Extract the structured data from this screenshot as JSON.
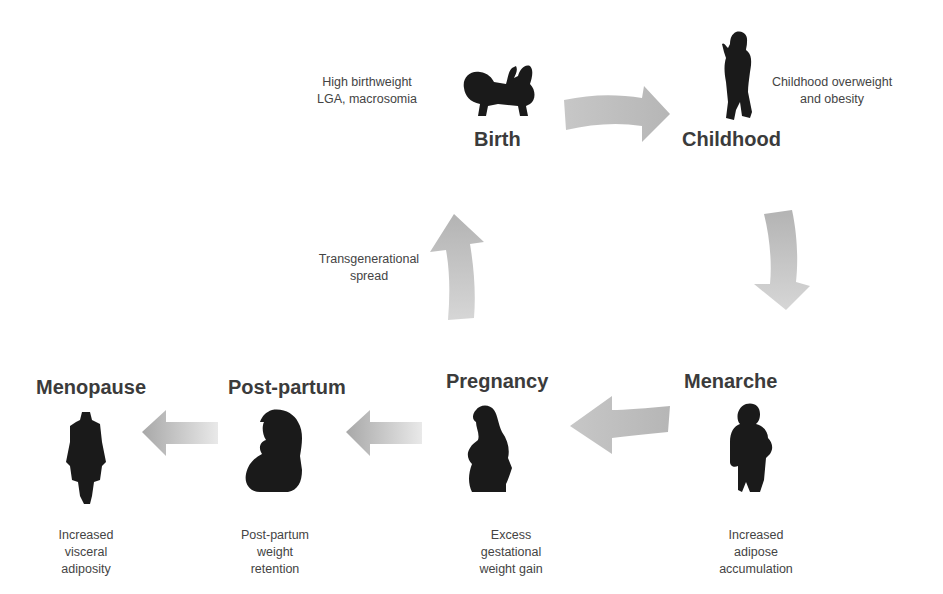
{
  "diagram": {
    "type": "cycle",
    "stages": [
      {
        "id": "birth",
        "label": "Birth",
        "note": "High birthweight\nLGA, macrosomia",
        "icon": "infant-silhouette-icon"
      },
      {
        "id": "childhood",
        "label": "Childhood",
        "note": "Childhood overweight\nand obesity",
        "icon": "child-silhouette-icon"
      },
      {
        "id": "menarche",
        "label": "Menarche",
        "note": "Increased\nadipose\naccumulation",
        "icon": "adolescent-girl-silhouette-icon"
      },
      {
        "id": "pregnancy",
        "label": "Pregnancy",
        "note": "Excess\ngestational\nweight gain",
        "icon": "pregnant-woman-silhouette-icon"
      },
      {
        "id": "postpartum",
        "label": "Post-partum",
        "note": "Post-partum\nweight\nretention",
        "icon": "mother-holding-baby-silhouette-icon"
      },
      {
        "id": "menopause",
        "label": "Menopause",
        "note": "Increased\nvisceral\nadiposity",
        "icon": "woman-coat-silhouette-icon"
      }
    ],
    "loop_note": "Transgenerational\nspread",
    "arrows": [
      {
        "from": "birth",
        "to": "childhood",
        "direction": "right"
      },
      {
        "from": "childhood",
        "to": "menarche",
        "direction": "down"
      },
      {
        "from": "menarche",
        "to": "pregnancy",
        "direction": "left"
      },
      {
        "from": "pregnancy",
        "to": "postpartum",
        "direction": "left"
      },
      {
        "from": "postpartum",
        "to": "menopause",
        "direction": "left"
      },
      {
        "from": "pregnancy",
        "to": "birth",
        "direction": "up"
      }
    ],
    "colors": {
      "arrow": "#b8b8b8",
      "arrow_dark": "#9a9a9a",
      "silhouette": "#1a1a1a",
      "text": "#3b3b3b"
    }
  }
}
